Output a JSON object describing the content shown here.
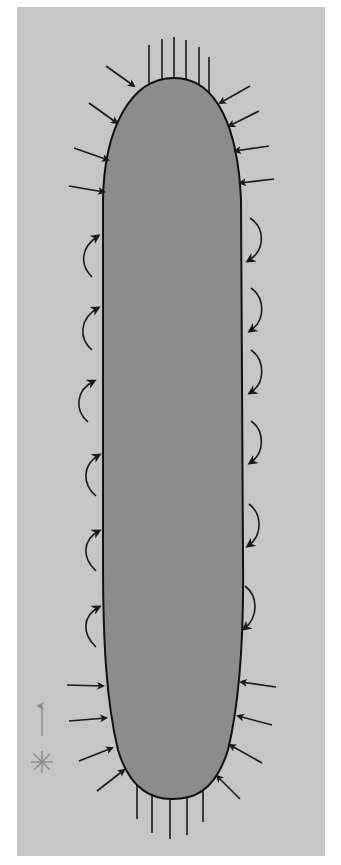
{
  "diagram": {
    "type": "cell-shape-schematic",
    "colors": {
      "page": "#ffffff",
      "panel": "#c6c6c6",
      "body_fill": "#8c8c8c",
      "outline": "#111111",
      "arrow": "#1a1a1a",
      "legend": "#8a8a8a"
    },
    "elements": {
      "top_lines_count": 6,
      "bottom_lines_count": 5,
      "top_left_straight_arrows": 4,
      "top_right_straight_arrows": 4,
      "bottom_left_straight_arrows": 4,
      "bottom_right_straight_arrows": 4,
      "left_curved_arrows": 6,
      "right_curved_arrows": 6
    },
    "legend": {
      "items": [
        {
          "symbol": "up-arrow",
          "meaning": ""
        },
        {
          "symbol": "asterisk",
          "meaning": ""
        }
      ]
    }
  }
}
